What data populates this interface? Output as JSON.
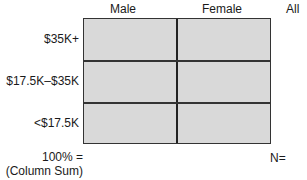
{
  "columns": [
    "Male",
    "Female",
    "All"
  ],
  "rows": [
    "$35K+",
    "$17.5K–$35K",
    "<$17.5K"
  ],
  "footer": {
    "total_label_line1": "100% =",
    "total_label_line2": "(Column Sum)",
    "n_label": "N="
  },
  "colors": {
    "cell_fill": "#d9d9d9",
    "grid_line": "#333333"
  }
}
